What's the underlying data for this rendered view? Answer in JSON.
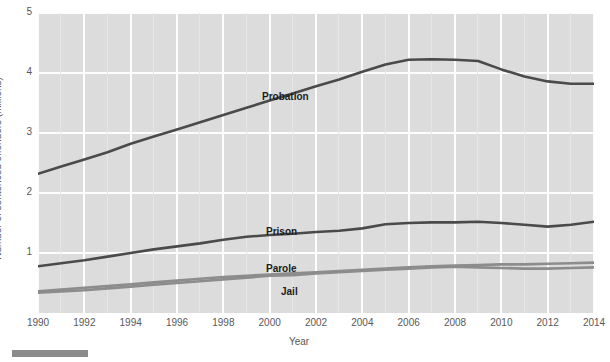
{
  "chart_data": {
    "type": "line",
    "title": "",
    "xlabel": "Year",
    "ylabel": "Number of sentenced offenders (millions)",
    "xlim": [
      1990,
      2014
    ],
    "ylim": [
      0,
      5
    ],
    "yticks": [
      1,
      2,
      3,
      4,
      5
    ],
    "ytick_labels": [
      "1",
      "2",
      "3",
      "4",
      "5"
    ],
    "xticks": [
      1990,
      1992,
      1994,
      1996,
      1998,
      2000,
      2002,
      2004,
      2006,
      2008,
      2010,
      2012,
      2014
    ],
    "xtick_labels": [
      "1990",
      "1992",
      "1994",
      "1996",
      "1998",
      "2000",
      "2002",
      "2004",
      "2006",
      "2008",
      "2010",
      "2012",
      "2014"
    ],
    "grid": true,
    "legend_position": "inline-labels",
    "x": [
      1990,
      1991,
      1992,
      1993,
      1994,
      1995,
      1996,
      1997,
      1998,
      1999,
      2000,
      2001,
      2002,
      2003,
      2004,
      2005,
      2006,
      2007,
      2008,
      2009,
      2010,
      2011,
      2012,
      2013,
      2014
    ],
    "series": [
      {
        "name": "Probation",
        "color": "#4a4a4a",
        "label_x": 1990,
        "values": [
          2.32,
          2.44,
          2.56,
          2.68,
          2.82,
          2.94,
          3.06,
          3.18,
          3.3,
          3.42,
          3.54,
          3.66,
          3.78,
          3.89,
          4.02,
          4.14,
          4.22,
          4.23,
          4.22,
          4.2,
          4.06,
          3.94,
          3.86,
          3.82,
          3.82
        ]
      },
      {
        "name": "Prison",
        "color": "#4a4a4a",
        "values": [
          0.78,
          0.83,
          0.88,
          0.94,
          1.0,
          1.06,
          1.11,
          1.16,
          1.22,
          1.27,
          1.3,
          1.32,
          1.35,
          1.37,
          1.41,
          1.48,
          1.5,
          1.51,
          1.51,
          1.52,
          1.5,
          1.47,
          1.44,
          1.47,
          1.52
        ]
      },
      {
        "name": "Parole",
        "color": "#8c8c8c",
        "values": [
          0.36,
          0.39,
          0.42,
          0.45,
          0.48,
          0.51,
          0.54,
          0.57,
          0.6,
          0.62,
          0.64,
          0.66,
          0.68,
          0.7,
          0.72,
          0.74,
          0.76,
          0.78,
          0.79,
          0.8,
          0.81,
          0.81,
          0.82,
          0.83,
          0.84
        ]
      },
      {
        "name": "Jail",
        "color": "#8c8c8c",
        "values": [
          0.34,
          0.36,
          0.38,
          0.41,
          0.44,
          0.47,
          0.5,
          0.53,
          0.56,
          0.59,
          0.62,
          0.63,
          0.66,
          0.68,
          0.7,
          0.72,
          0.74,
          0.76,
          0.77,
          0.76,
          0.75,
          0.74,
          0.74,
          0.75,
          0.76
        ]
      }
    ],
    "inline_labels": [
      {
        "text": "Probation",
        "x": 262,
        "y": 91
      },
      {
        "text": "Prison",
        "x": 266,
        "y": 226
      },
      {
        "text": "Parole",
        "x": 266,
        "y": 263
      },
      {
        "text": "Jail",
        "x": 281,
        "y": 286
      }
    ]
  }
}
